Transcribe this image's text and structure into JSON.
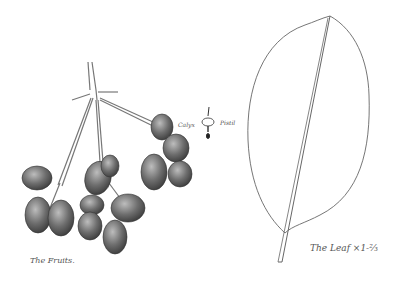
{
  "illustration": {
    "subject": "Botanical sketch of fruits and leaf",
    "labels": {
      "fruits": "The Fruits.",
      "leaf": "The Leaf ×1-⅔",
      "calyx": "Calyx",
      "pistil": "Pistil"
    },
    "colors": {
      "background": "#ffffff",
      "ink": "#444444",
      "fruit_shade": "#6a6a6a"
    }
  }
}
